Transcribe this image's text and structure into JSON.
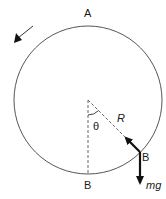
{
  "diagram": {
    "labels": {
      "top_point": "A",
      "bottom_point": "B",
      "particle_point": "B",
      "angle": "θ",
      "reaction_force": "R",
      "weight_force": "mg"
    },
    "colors": {
      "circle": "#555555",
      "dashed": "#666666",
      "force_arrow": "#111111",
      "text": "#1a1a1a"
    },
    "geometry": {
      "center": [
        88,
        100
      ],
      "radius": 74,
      "particle": [
        140,
        152
      ]
    },
    "rotation_direction": "counterclockwise"
  }
}
